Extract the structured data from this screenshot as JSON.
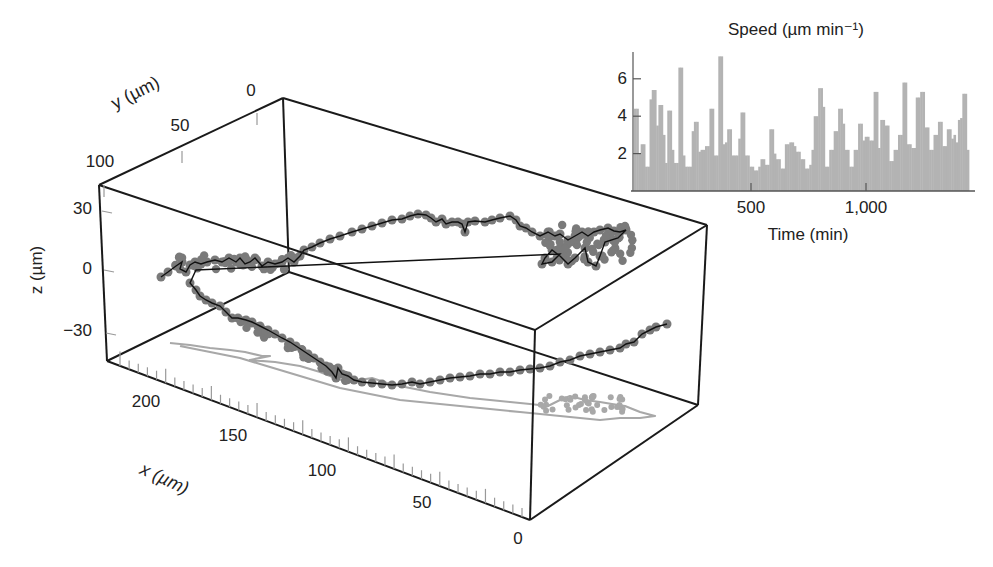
{
  "chart_data": [
    {
      "type": "scatter3d",
      "title": "",
      "xlabel": "x (µm)",
      "ylabel": "y (µm)",
      "zlabel": "z (µm)",
      "x_ticks": [
        "200",
        "150",
        "100",
        "50",
        "0"
      ],
      "y_ticks": [
        "0",
        "50",
        "100"
      ],
      "z_ticks": [
        "30",
        "0",
        "−30"
      ],
      "xlim": [
        0,
        220
      ],
      "ylim": [
        0,
        100
      ],
      "zlim": [
        -45,
        40
      ],
      "box_on": true,
      "grid": false,
      "series": [
        {
          "name": "trajectory",
          "style": "line+markers",
          "color": "#7a7a7a",
          "line_color": "#111111"
        },
        {
          "name": "xy-projection",
          "style": "line",
          "color": "#a8a8a8"
        }
      ],
      "notes": "Cell migration track rendered in 3D box with grey shadow projection on floor"
    },
    {
      "type": "bar",
      "title": "Speed (µm min⁻¹)",
      "xlabel": "Time (min)",
      "ylabel": "",
      "x_ticks": [
        "500",
        "1,000"
      ],
      "y_ticks": [
        "2",
        "4",
        "6"
      ],
      "xlim": [
        0,
        1455
      ],
      "ylim": [
        0,
        7.2
      ],
      "bin_width_min": 10,
      "color": "#b3b3b3",
      "values": [
        4.4,
        4.4,
        2.0,
        2.5,
        2.5,
        1.3,
        1.3,
        4.9,
        5.4,
        5.4,
        3.5,
        4.6,
        4.6,
        3.0,
        1.5,
        4.3,
        4.3,
        2.2,
        1.5,
        1.5,
        6.6,
        6.6,
        1.9,
        1.3,
        1.3,
        1.3,
        3.2,
        3.7,
        3.7,
        2.1,
        2.2,
        2.2,
        2.4,
        2.4,
        4.4,
        4.4,
        1.9,
        1.9,
        7.2,
        7.2,
        2.5,
        2.6,
        3.3,
        3.3,
        1.9,
        1.9,
        1.9,
        2.8,
        4.2,
        4.2,
        1.9,
        1.9,
        1.3,
        1.3,
        1.1,
        1.1,
        1.3,
        1.7,
        1.7,
        1.4,
        1.4,
        3.3,
        3.3,
        2.0,
        1.7,
        1.7,
        1.2,
        1.2,
        2.5,
        2.5,
        2.6,
        2.6,
        2.4,
        2.1,
        2.1,
        1.7,
        1.7,
        1.2,
        1.2,
        1.4,
        2.2,
        4.0,
        4.0,
        5.5,
        5.5,
        4.5,
        1.3,
        1.3,
        2.2,
        2.2,
        3.2,
        3.2,
        4.4,
        4.4,
        3.6,
        2.2,
        2.2,
        1.3,
        1.3,
        2.2,
        2.2,
        3.6,
        3.6,
        2.7,
        2.9,
        2.9,
        2.7,
        2.7,
        5.3,
        5.3,
        2.3,
        3.8,
        3.8,
        3.5,
        3.5,
        1.6,
        1.6,
        2.2,
        2.2,
        3.0,
        3.0,
        5.8,
        5.8,
        2.5,
        2.5,
        2.3,
        2.3,
        5.0,
        5.0,
        5.3,
        5.3,
        3.4,
        3.4,
        2.2,
        2.2,
        3.0,
        3.0,
        3.7,
        3.7,
        2.4,
        2.4,
        3.3,
        3.3,
        2.8,
        3.0,
        2.6,
        3.8,
        3.9,
        5.2,
        5.2,
        2.2
      ],
      "grid": false
    }
  ]
}
